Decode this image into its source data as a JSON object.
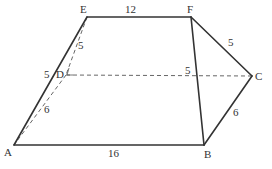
{
  "diagram": {
    "type": "geometry-figure",
    "points": {
      "A": {
        "label": "A",
        "x": 14,
        "y": 145,
        "lx": 4,
        "ly": 156
      },
      "B": {
        "label": "B",
        "x": 204,
        "y": 145,
        "lx": 204,
        "ly": 158
      },
      "C": {
        "label": "C",
        "x": 252,
        "y": 76,
        "lx": 255,
        "ly": 80
      },
      "D": {
        "label": "D",
        "x": 66,
        "y": 75,
        "lx": 56,
        "ly": 78
      },
      "E": {
        "label": "E",
        "x": 87,
        "y": 17,
        "lx": 80,
        "ly": 13
      },
      "F": {
        "label": "F",
        "x": 191,
        "y": 17,
        "lx": 187,
        "ly": 13
      }
    },
    "solid_edges": [
      {
        "from": "A",
        "to": "E"
      },
      {
        "from": "E",
        "to": "F"
      },
      {
        "from": "F",
        "to": "C"
      },
      {
        "from": "C",
        "to": "B"
      },
      {
        "from": "B",
        "to": "A"
      },
      {
        "from": "F",
        "to": "B"
      }
    ],
    "dashed_edges": [
      {
        "from": "E",
        "to": "D"
      },
      {
        "from": "D",
        "to": "A"
      },
      {
        "from": "D",
        "to": "C"
      }
    ],
    "edge_labels": [
      {
        "edge": "EF",
        "text": "12",
        "x": 125,
        "y": 13
      },
      {
        "edge": "AB",
        "text": "16",
        "x": 108,
        "y": 157
      },
      {
        "edge": "AE",
        "text": "5",
        "x": 44,
        "y": 78
      },
      {
        "edge": "ED",
        "text": "5",
        "x": 78,
        "y": 49
      },
      {
        "edge": "DA",
        "text": "6",
        "x": 44,
        "y": 113
      },
      {
        "edge": "FB",
        "text": "5",
        "x": 185,
        "y": 74
      },
      {
        "edge": "FC",
        "text": "5",
        "x": 228,
        "y": 46
      },
      {
        "edge": "CB",
        "text": "6",
        "x": 233,
        "y": 116
      }
    ],
    "colors": {
      "stroke": "#333333",
      "dashed": "#555555",
      "background": "#ffffff"
    }
  }
}
